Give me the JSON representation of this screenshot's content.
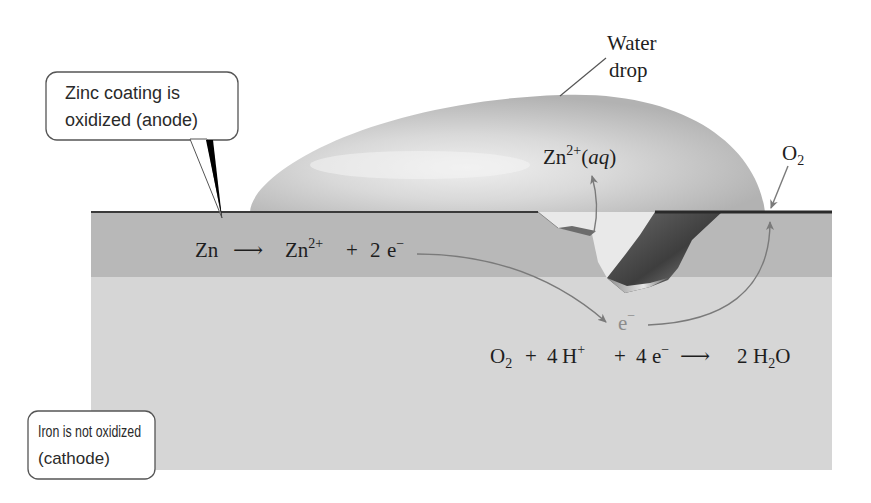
{
  "labels": {
    "water_drop": {
      "line1": "Water",
      "line2": "drop"
    },
    "oxygen": {
      "main": "O",
      "sub": "2"
    },
    "zinc_ion": {
      "main": "Zn",
      "sup": "2+",
      "open": "(",
      "state": "aq",
      "close": ")"
    },
    "electron": {
      "main": "e",
      "sup": "−"
    }
  },
  "callouts": {
    "anode": {
      "line1": "Zinc coating is",
      "line2": "oxidized (anode)"
    },
    "cathode": {
      "line1": "Iron is not oxidized",
      "line2": "(cathode)"
    }
  },
  "equations": {
    "anode": {
      "reactant": "Zn",
      "arrow": "⟶",
      "product_ion": "Zn",
      "product_ion_sup": "2+",
      "plus": "+",
      "electron_coeff": "2",
      "electron": "e",
      "electron_sup": "−"
    },
    "cathode": {
      "o2": "O",
      "o2_sub": "2",
      "plus1": "+",
      "h_coeff": "4",
      "h": "H",
      "h_sup": "+",
      "plus2": "+",
      "e_coeff": "4",
      "e": "e",
      "e_sup": "−",
      "arrow": "⟶",
      "water_coeff": "2",
      "water_h": "H",
      "water_sub": "2",
      "water_o": "O"
    }
  },
  "colors": {
    "zinc_layer": "#b8b8b8",
    "iron_layer": "#d6d6d6",
    "surface_line": "#3a3a3a",
    "arrow": "#7a7a7a",
    "electron_label": "#8c8c8c"
  }
}
